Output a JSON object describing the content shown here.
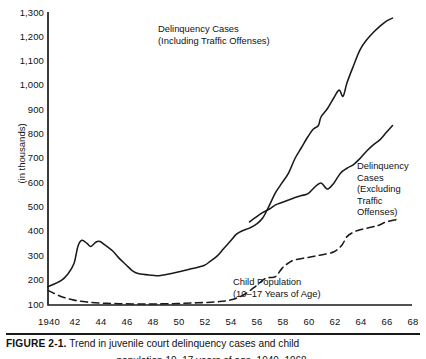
{
  "figure": {
    "caption_label": "FIGURE 2-1.",
    "caption_text": " Trend in juvenile court delinquency cases and child",
    "caption_continued": "population 10–17 years of age, 1940–1968."
  },
  "chart_data": {
    "type": "line",
    "title": "",
    "xlabel": "",
    "ylabel": "(in thousands)",
    "xlim": [
      1940,
      1968
    ],
    "ylim": [
      100,
      1300
    ],
    "grid": false,
    "legend_position": "inline-annotations",
    "yticks": [
      "1,300",
      "1,200",
      "1,100",
      "1,000",
      "900",
      "800",
      "700",
      "600",
      "500",
      "400",
      "300",
      "200",
      "100"
    ],
    "ytick_values": [
      1300,
      1200,
      1100,
      1000,
      900,
      800,
      700,
      600,
      500,
      400,
      300,
      200,
      100
    ],
    "xticks": [
      "1940",
      "42",
      "44",
      "46",
      "48",
      "50",
      "52",
      "54",
      "56",
      "58",
      "60",
      "62",
      "64",
      "66",
      "68"
    ],
    "xtick_values": [
      1940,
      1942,
      1944,
      1946,
      1948,
      1950,
      1952,
      1954,
      1956,
      1958,
      1960,
      1962,
      1964,
      1966,
      1968
    ],
    "series": [
      {
        "name": "Delinquency Cases (Including Traffic Offenses)",
        "style": "solid",
        "color": "#1a1a1a",
        "annotation_lines": [
          "Delinquency Cases",
          "(Including Traffic Offenses)"
        ],
        "x": [
          1940,
          1941,
          1941.5,
          1942,
          1942.3,
          1942.6,
          1943,
          1943.3,
          1943.7,
          1944,
          1944.4,
          1945,
          1945.5,
          1946,
          1946.5,
          1947,
          1948,
          1948.5,
          1949,
          1950,
          1951,
          1952,
          1952.5,
          1953,
          1953.5,
          1954,
          1954.5,
          1955,
          1955.5,
          1956,
          1956.5,
          1957,
          1957.5,
          1958,
          1958.5,
          1959,
          1959.5,
          1960,
          1960.4,
          1960.8,
          1961,
          1961.5,
          1962,
          1962.4,
          1962.7,
          1963,
          1963.5,
          1964,
          1964.5,
          1965,
          1965.5,
          1966,
          1966.5
        ],
        "y": [
          175,
          200,
          225,
          270,
          340,
          365,
          352,
          340,
          358,
          360,
          345,
          320,
          290,
          265,
          240,
          228,
          222,
          220,
          224,
          235,
          248,
          262,
          280,
          300,
          330,
          360,
          390,
          405,
          415,
          430,
          455,
          505,
          560,
          600,
          640,
          700,
          745,
          790,
          820,
          835,
          870,
          905,
          950,
          980,
          955,
          1010,
          1080,
          1145,
          1185,
          1215,
          1240,
          1262,
          1275
        ]
      },
      {
        "name": "Delinquency Cases (Excluding Traffic Offenses)",
        "style": "solid",
        "color": "#1a1a1a",
        "annotation_lines": [
          "Delinquency",
          "Cases",
          "(Excluding",
          "Traffic",
          "Offenses)"
        ],
        "x": [
          1955.5,
          1956,
          1956.5,
          1957,
          1957.5,
          1958,
          1958.5,
          1959,
          1959.5,
          1960,
          1960.5,
          1961,
          1961.5,
          1962,
          1962.5,
          1963,
          1963.5,
          1964,
          1964.5,
          1965,
          1965.5,
          1966,
          1966.5
        ],
        "y": [
          440,
          460,
          478,
          492,
          510,
          520,
          530,
          540,
          548,
          556,
          582,
          600,
          575,
          600,
          640,
          660,
          675,
          700,
          730,
          755,
          775,
          805,
          835
        ]
      },
      {
        "name": "Child Population (10-17 Years of Age)",
        "style": "dashed",
        "color": "#1a1a1a",
        "annotation_lines": [
          "Child Population",
          "(10–17 Years of Age)"
        ],
        "x": [
          1940,
          1941,
          1942,
          1943,
          1944,
          1945,
          1946,
          1947,
          1948,
          1949,
          1950,
          1951,
          1952,
          1953,
          1954,
          1955,
          1956,
          1956.6,
          1957,
          1957.5,
          1958,
          1958.5,
          1959,
          1960,
          1961,
          1962,
          1962.6,
          1963,
          1963.5,
          1964,
          1965,
          1965.5,
          1966,
          1966.8
        ],
        "y": [
          160,
          135,
          120,
          112,
          108,
          106,
          105,
          104,
          104,
          105,
          106,
          108,
          110,
          113,
          120,
          140,
          178,
          205,
          212,
          216,
          250,
          272,
          285,
          295,
          305,
          318,
          345,
          380,
          398,
          408,
          420,
          428,
          440,
          450
        ]
      }
    ]
  }
}
